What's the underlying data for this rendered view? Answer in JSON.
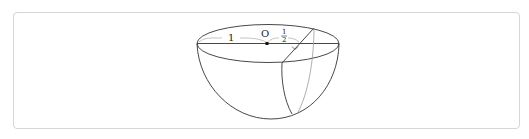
{
  "figure": {
    "labels": {
      "center": "O",
      "radius": "1",
      "distance_numerator": "1",
      "distance_denominator": "2"
    },
    "colors": {
      "stroke": "#333333",
      "hidden_stroke": "#9a9a9a",
      "frame_border": "#d6d6d6"
    }
  }
}
